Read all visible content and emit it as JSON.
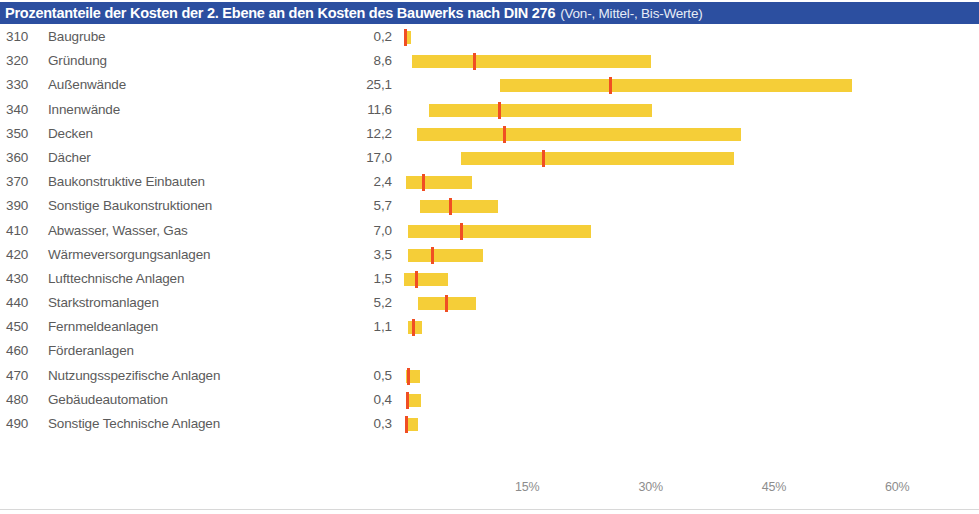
{
  "header": {
    "title_main": "Prozentanteile der Kosten der 2. Ebene an den Kosten des Bauwerks nach DIN 276",
    "title_sub": "(Von-, Mittel-, Bis-Werte)",
    "background_color": "#2c4fa0",
    "text_color": "#ffffff"
  },
  "colors": {
    "bar": "#f5ce38",
    "marker": "#f04e23",
    "text": "#5b5b5b",
    "axis_text": "#8d8d8d"
  },
  "chart_data": {
    "type": "bar",
    "title": "Prozentanteile der Kosten der 2. Ebene an den Kosten des Bauwerks nach DIN 276",
    "subtitle": "(Von-, Mittel-, Bis-Werte)",
    "xlabel": "",
    "ylabel": "",
    "xlim": [
      0,
      63
    ],
    "grid": false,
    "legend": "none",
    "axis_ticks": [
      {
        "label": "15%",
        "value": 15
      },
      {
        "label": "30%",
        "value": 30
      },
      {
        "label": "45%",
        "value": 45
      },
      {
        "label": "60%",
        "value": 60
      }
    ],
    "series": [
      {
        "name": "von (low)"
      },
      {
        "name": "mittel (mid)"
      },
      {
        "name": "bis (high)"
      }
    ],
    "categories": [
      {
        "code": "310",
        "label": "Baugrube",
        "value_label": "0,2",
        "low": 0.1,
        "mid": 0.2,
        "high": 0.9
      },
      {
        "code": "320",
        "label": "Gründung",
        "value_label": "8,6",
        "low": 1.0,
        "mid": 8.6,
        "high": 30.0
      },
      {
        "code": "330",
        "label": "Außenwände",
        "value_label": "25,1",
        "low": 11.7,
        "mid": 25.1,
        "high": 54.5
      },
      {
        "code": "340",
        "label": "Innenwände",
        "value_label": "11,6",
        "low": 3.0,
        "mid": 11.6,
        "high": 30.2
      },
      {
        "code": "350",
        "label": "Decken",
        "value_label": "12,2",
        "low": 1.6,
        "mid": 12.2,
        "high": 41.0
      },
      {
        "code": "360",
        "label": "Dächer",
        "value_label": "17,0",
        "low": 6.9,
        "mid": 17.0,
        "high": 40.1
      },
      {
        "code": "370",
        "label": "Baukonstruktive Einbauten",
        "value_label": "2,4",
        "low": 0.2,
        "mid": 2.4,
        "high": 8.3
      },
      {
        "code": "390",
        "label": "Sonstige Baukonstruktionen",
        "value_label": "5,7",
        "low": 2.0,
        "mid": 5.7,
        "high": 11.4
      },
      {
        "code": "410",
        "label": "Abwasser, Wasser, Gas",
        "value_label": "7,0",
        "low": 0.5,
        "mid": 7.0,
        "high": 22.7
      },
      {
        "code": "420",
        "label": "Wärmeversorgungsanlagen",
        "value_label": "3,5",
        "low": 0.5,
        "mid": 3.5,
        "high": 9.6
      },
      {
        "code": "430",
        "label": "Lufttechnische Anlagen",
        "value_label": "1,5",
        "low": 0.0,
        "mid": 1.5,
        "high": 5.4
      },
      {
        "code": "440",
        "label": "Starkstromanlagen",
        "value_label": "5,2",
        "low": 1.7,
        "mid": 5.2,
        "high": 8.7
      },
      {
        "code": "450",
        "label": "Fernmeldeanlagen",
        "value_label": "1,1",
        "low": 0.5,
        "mid": 1.1,
        "high": 2.2
      },
      {
        "code": "460",
        "label": "Förderanlagen",
        "value_label": "",
        "low": null,
        "mid": null,
        "high": null
      },
      {
        "code": "470",
        "label": "Nutzungsspezifische Anlagen",
        "value_label": "0,5",
        "low": 0.2,
        "mid": 0.5,
        "high": 2.0
      },
      {
        "code": "480",
        "label": "Gebäudeautomation",
        "value_label": "0,4",
        "low": 0.2,
        "mid": 0.4,
        "high": 2.1
      },
      {
        "code": "490",
        "label": "Sonstige Technische Anlagen",
        "value_label": "0,3",
        "low": 0.1,
        "mid": 0.3,
        "high": 1.7
      }
    ]
  }
}
